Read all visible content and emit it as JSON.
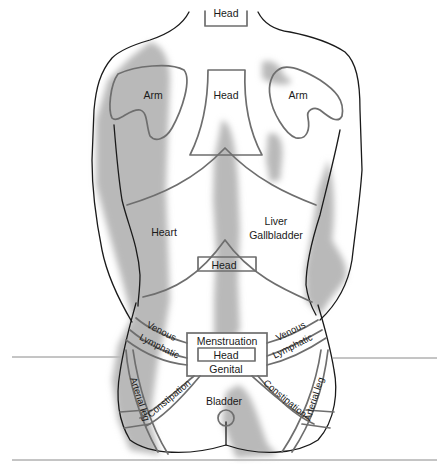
{
  "figure": {
    "type": "reflex zone map of the back",
    "shading_color": "#b9b9b9",
    "outline_color": "#1a1a1a",
    "zone_line_color": "#6e6e6e"
  },
  "labels": {
    "neck_head": "Head",
    "arm_left": "Arm",
    "arm_right": "Arm",
    "upper_head": "Head",
    "heart": "Heart",
    "liver_line1": "Liver",
    "liver_line2": "Gallbladder",
    "mid_head": "Head",
    "venous_left": "Venous",
    "lymphatic_left": "Lymphatic",
    "venous_right": "Venous",
    "lymphatic_right": "Lymphatic",
    "menstruation": "Menstruation",
    "sacral_head": "Head",
    "genital": "Genital",
    "constipation_left": "Constipation",
    "constipation_right": "Constipation",
    "arterial_leg_left": "Arterial leg",
    "arterial_leg_right": "Arterial leg",
    "bladder": "Bladder"
  }
}
